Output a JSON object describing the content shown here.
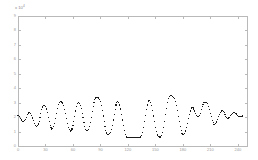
{
  "figure": {
    "background_color": "#ffffff",
    "frame_color": "#b9b9b9",
    "marker_color": "#1a1a1a",
    "tick_label_color": "#9b9b9b",
    "exponent_label": "x 10",
    "exponent_value": "4",
    "plot_box": {
      "left": 18,
      "top": 16,
      "right": 247,
      "bottom": 146
    }
  },
  "chart_data": {
    "type": "scatter",
    "title": "",
    "xlabel": "",
    "ylabel": "",
    "xlim": [
      0,
      250
    ],
    "ylim": [
      0,
      9
    ],
    "grid": false,
    "legend": null,
    "marker": "dot",
    "marker_size": 1.1,
    "xticks": [
      0,
      30,
      60,
      90,
      120,
      150,
      180,
      210,
      240
    ],
    "xticklabels": [
      "0",
      "30",
      "60",
      "90",
      "120",
      "150",
      "180",
      "210",
      "240"
    ],
    "yticks": [
      0,
      1,
      2,
      3,
      4,
      5,
      6,
      7,
      8,
      9
    ],
    "yticklabels": [
      "0",
      "1",
      "2",
      "3",
      "4",
      "5",
      "6",
      "7",
      "8",
      "9"
    ],
    "x": [
      0,
      1,
      2,
      3,
      4,
      5,
      6,
      7,
      8,
      9,
      10,
      11,
      12,
      13,
      14,
      15,
      16,
      17,
      18,
      19,
      20,
      21,
      22,
      23,
      24,
      25,
      26,
      27,
      28,
      29,
      30,
      31,
      32,
      33,
      34,
      35,
      36,
      37,
      38,
      39,
      40,
      41,
      42,
      43,
      44,
      45,
      46,
      47,
      48,
      49,
      50,
      51,
      52,
      53,
      54,
      55,
      56,
      57,
      58,
      59,
      60,
      61,
      62,
      63,
      64,
      65,
      66,
      67,
      68,
      69,
      70,
      71,
      72,
      73,
      74,
      75,
      76,
      77,
      78,
      79,
      80,
      81,
      82,
      83,
      84,
      85,
      86,
      87,
      88,
      89,
      90,
      91,
      92,
      93,
      94,
      95,
      96,
      97,
      98,
      99,
      100,
      101,
      102,
      103,
      104,
      105,
      106,
      107,
      108,
      109,
      110,
      111,
      112,
      113,
      114,
      115,
      116,
      117,
      118,
      119,
      120,
      121,
      122,
      123,
      124,
      125,
      126,
      127,
      128,
      129,
      130,
      131,
      132,
      133,
      134,
      135,
      136,
      137,
      138,
      139,
      140,
      141,
      142,
      143,
      144,
      145,
      146,
      147,
      148,
      149,
      150,
      151,
      152,
      153,
      154,
      155,
      156,
      157,
      158,
      159,
      160,
      161,
      162,
      163,
      164,
      165,
      166,
      167,
      168,
      169,
      170,
      171,
      172,
      173,
      174,
      175,
      176,
      177,
      178,
      179,
      180,
      181,
      182,
      183,
      184,
      185,
      186,
      187,
      188,
      189,
      190,
      191,
      192,
      193,
      194,
      195,
      196,
      197,
      198,
      199,
      200,
      201,
      202,
      203,
      204,
      205,
      206,
      207,
      208,
      209,
      210,
      211,
      212,
      213,
      214,
      215,
      216,
      217,
      218,
      219,
      220,
      221,
      222,
      223,
      224,
      225,
      226,
      227,
      228,
      229,
      230,
      231,
      232,
      233,
      234,
      235,
      236,
      237,
      238,
      239,
      240,
      241,
      242,
      243,
      244,
      245,
      246,
      247,
      248,
      249
    ],
    "y": [
      2.1,
      2.12,
      2.05,
      1.92,
      1.8,
      1.72,
      1.7,
      1.74,
      1.86,
      2.0,
      2.16,
      2.28,
      2.34,
      2.34,
      2.26,
      2.12,
      1.94,
      1.74,
      1.56,
      1.44,
      1.38,
      1.4,
      1.52,
      1.72,
      1.98,
      2.26,
      2.52,
      2.7,
      2.8,
      2.82,
      2.74,
      2.56,
      2.3,
      2.0,
      1.7,
      1.44,
      1.26,
      1.18,
      1.2,
      1.34,
      1.58,
      1.9,
      2.26,
      2.6,
      2.86,
      3.02,
      3.06,
      3.06,
      3.04,
      2.96,
      2.8,
      2.54,
      2.22,
      1.88,
      1.56,
      1.3,
      1.12,
      1.04,
      1.06,
      1.18,
      1.4,
      1.7,
      2.06,
      2.42,
      2.72,
      2.92,
      3.0,
      2.96,
      2.82,
      2.58,
      2.28,
      1.96,
      1.64,
      1.36,
      1.16,
      1.06,
      1.06,
      1.16,
      1.36,
      1.64,
      1.98,
      2.36,
      2.72,
      3.02,
      3.22,
      3.32,
      3.34,
      3.34,
      3.32,
      3.24,
      3.06,
      2.8,
      2.46,
      2.08,
      1.7,
      1.36,
      1.08,
      0.9,
      0.82,
      0.82,
      0.84,
      0.94,
      1.14,
      1.44,
      1.8,
      2.18,
      2.54,
      2.84,
      3.02,
      3.08,
      3.02,
      2.84,
      2.56,
      2.2,
      1.8,
      1.42,
      1.08,
      0.82,
      0.66,
      0.6,
      0.58,
      0.58,
      0.58,
      0.58,
      0.58,
      0.58,
      0.58,
      0.58,
      0.58,
      0.58,
      0.58,
      0.58,
      0.58,
      0.58,
      0.62,
      0.74,
      0.96,
      1.28,
      1.68,
      2.1,
      2.5,
      2.84,
      3.06,
      3.16,
      3.14,
      3.02,
      2.78,
      2.46,
      2.08,
      1.68,
      1.3,
      0.98,
      0.76,
      0.64,
      0.62,
      0.62,
      0.64,
      0.74,
      0.96,
      1.3,
      1.72,
      2.18,
      2.62,
      3.0,
      3.28,
      3.44,
      3.5,
      3.5,
      3.48,
      3.44,
      3.38,
      3.26,
      3.06,
      2.78,
      2.44,
      2.06,
      1.68,
      1.34,
      1.06,
      0.88,
      0.8,
      0.8,
      0.88,
      1.04,
      1.28,
      1.58,
      1.9,
      2.18,
      2.42,
      2.58,
      2.66,
      2.64,
      2.56,
      2.42,
      2.26,
      2.12,
      2.04,
      2.04,
      2.12,
      2.28,
      2.5,
      2.72,
      2.9,
      3.0,
      3.02,
      3.02,
      3.0,
      2.92,
      2.76,
      2.54,
      2.28,
      2.02,
      1.78,
      1.6,
      1.5,
      1.48,
      1.54,
      1.66,
      1.84,
      2.02,
      2.2,
      2.34,
      2.42,
      2.44,
      2.4,
      2.3,
      2.18,
      2.06,
      1.96,
      1.92,
      1.94,
      2.0,
      2.1,
      2.2,
      2.28,
      2.32,
      2.32,
      2.28,
      2.22,
      2.16,
      2.1,
      2.06,
      2.04,
      2.04,
      2.06,
      2.08
    ]
  }
}
